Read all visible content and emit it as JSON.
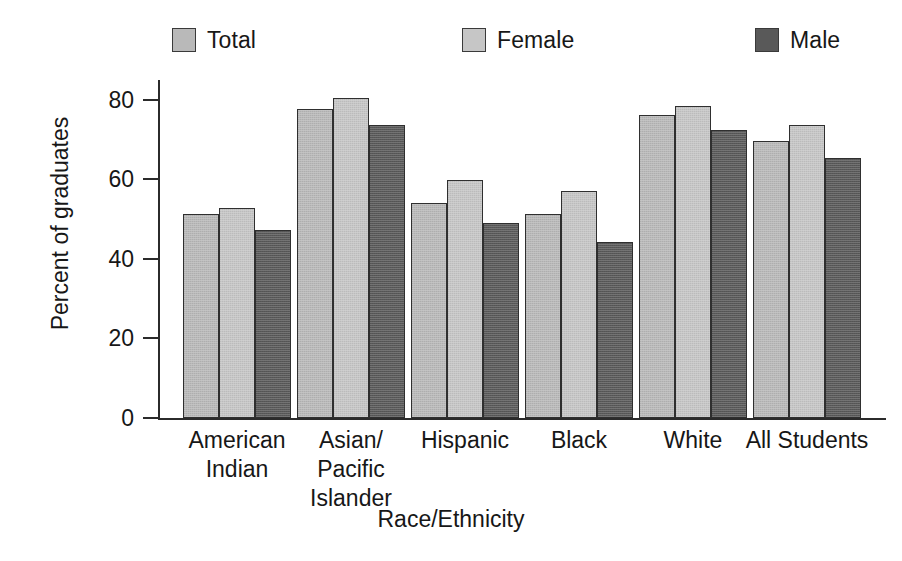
{
  "chart_data": {
    "type": "bar",
    "title": "",
    "xlabel": "Race/Ethnicity",
    "ylabel": "Percent of graduates",
    "ylim": [
      0,
      85
    ],
    "yticks": [
      0,
      20,
      40,
      60,
      80
    ],
    "ytick_labels": [
      "0",
      "20",
      "40",
      "60",
      "80"
    ],
    "grid": false,
    "legend_position": "top",
    "categories": [
      "American Indian",
      "Asian/Pacific Islander",
      "Hispanic",
      "Black",
      "White",
      "All Students"
    ],
    "category_lines": [
      [
        "American",
        "Indian"
      ],
      [
        "Asian/",
        "Pacific",
        "Islander"
      ],
      [
        "Hispanic"
      ],
      [
        "Black"
      ],
      [
        "White"
      ],
      [
        "All Students"
      ]
    ],
    "series": [
      {
        "name": "Total",
        "color": "#b9b9b9",
        "values": [
          51.2,
          77.6,
          54.0,
          51.2,
          76.2,
          69.6
        ]
      },
      {
        "name": "Female",
        "color": "#c6c6c6",
        "values": [
          52.7,
          80.6,
          59.9,
          57.1,
          78.4,
          73.7
        ]
      },
      {
        "name": "Male",
        "color": "#595959",
        "values": [
          47.4,
          73.7,
          49.0,
          44.3,
          72.4,
          65.5
        ]
      }
    ]
  },
  "legend": {
    "items": [
      {
        "label": "Total",
        "color": "#b9b9b9"
      },
      {
        "label": "Female",
        "color": "#c6c6c6"
      },
      {
        "label": "Male",
        "color": "#595959"
      }
    ]
  },
  "axes": {
    "y_title": "Percent of graduates",
    "x_title": "Race/Ethnicity"
  },
  "colors": {
    "axis": "#2b2b2b",
    "text": "#171717",
    "bar_outline": "#2f2f2f",
    "background": "#ffffff"
  }
}
